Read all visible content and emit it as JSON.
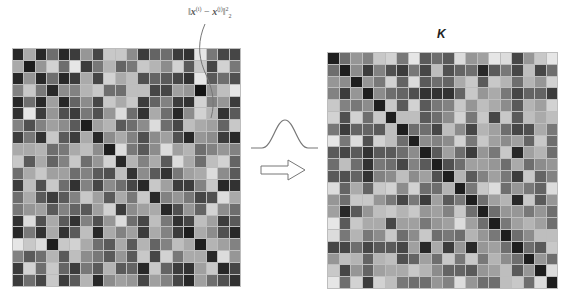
{
  "formula": {
    "norm_open": "‖",
    "x_i": "x",
    "sup_i": "(i)",
    "minus": " − ",
    "x_j": "x",
    "sup_j": "(j)",
    "norm_close": "‖",
    "sup_2": "2",
    "sub_2": "2"
  },
  "kernel_label": "K",
  "icons": {
    "gaussian": "gaussian-curve-icon",
    "arrow": "right-arrow-icon"
  },
  "colors": {
    "grid_line": "#bdbdbd",
    "curve": "#777777",
    "arrow_stroke": "#777777"
  },
  "left_matrix": {
    "size": 20,
    "shades": [
      [
        40,
        170,
        40,
        110,
        40,
        60,
        150,
        70,
        200,
        200,
        140,
        60,
        100,
        110,
        60,
        50,
        230,
        120,
        70,
        70
      ],
      [
        170,
        30,
        150,
        210,
        110,
        230,
        60,
        120,
        180,
        100,
        120,
        200,
        180,
        140,
        210,
        90,
        200,
        70,
        210,
        120
      ],
      [
        40,
        150,
        40,
        110,
        40,
        60,
        170,
        70,
        210,
        170,
        190,
        80,
        100,
        90,
        70,
        50,
        230,
        90,
        110,
        80
      ],
      [
        130,
        200,
        120,
        40,
        140,
        130,
        180,
        200,
        110,
        110,
        190,
        190,
        70,
        70,
        160,
        150,
        20,
        150,
        190,
        230
      ],
      [
        40,
        110,
        40,
        160,
        40,
        100,
        140,
        70,
        200,
        170,
        200,
        60,
        100,
        130,
        60,
        50,
        210,
        130,
        150,
        60
      ],
      [
        50,
        230,
        60,
        150,
        80,
        60,
        120,
        80,
        150,
        220,
        110,
        50,
        170,
        110,
        40,
        140,
        210,
        180,
        50,
        90
      ],
      [
        130,
        80,
        130,
        160,
        140,
        90,
        30,
        160,
        180,
        90,
        110,
        140,
        220,
        110,
        70,
        190,
        170,
        160,
        100,
        200
      ],
      [
        60,
        120,
        50,
        200,
        90,
        60,
        170,
        40,
        140,
        170,
        130,
        80,
        140,
        160,
        80,
        40,
        150,
        140,
        60,
        40
      ],
      [
        170,
        170,
        180,
        110,
        120,
        170,
        190,
        140,
        30,
        220,
        120,
        90,
        140,
        220,
        160,
        180,
        110,
        130,
        150,
        130
      ],
      [
        200,
        90,
        170,
        100,
        130,
        200,
        110,
        150,
        210,
        40,
        180,
        130,
        170,
        90,
        220,
        170,
        110,
        190,
        210,
        100
      ],
      [
        110,
        170,
        200,
        160,
        160,
        110,
        130,
        90,
        80,
        190,
        50,
        140,
        90,
        50,
        120,
        160,
        170,
        220,
        140,
        90
      ],
      [
        60,
        190,
        80,
        200,
        110,
        50,
        130,
        70,
        140,
        110,
        70,
        40,
        200,
        160,
        60,
        60,
        130,
        200,
        40,
        50
      ],
      [
        110,
        170,
        90,
        60,
        90,
        130,
        200,
        160,
        90,
        170,
        120,
        200,
        40,
        130,
        150,
        120,
        70,
        80,
        220,
        170
      ],
      [
        120,
        150,
        160,
        90,
        130,
        100,
        90,
        160,
        210,
        60,
        140,
        160,
        170,
        40,
        80,
        150,
        100,
        210,
        140,
        110
      ],
      [
        50,
        220,
        80,
        170,
        90,
        50,
        130,
        80,
        150,
        220,
        110,
        70,
        190,
        120,
        50,
        70,
        190,
        160,
        60,
        90
      ],
      [
        40,
        120,
        50,
        170,
        50,
        90,
        190,
        40,
        170,
        130,
        160,
        60,
        170,
        130,
        60,
        30,
        170,
        140,
        80,
        40
      ],
      [
        230,
        200,
        220,
        30,
        200,
        210,
        170,
        110,
        90,
        170,
        90,
        180,
        100,
        130,
        190,
        170,
        30,
        180,
        160,
        130
      ],
      [
        130,
        90,
        110,
        180,
        90,
        190,
        140,
        120,
        90,
        150,
        90,
        200,
        70,
        210,
        120,
        170,
        170,
        40,
        220,
        150
      ],
      [
        60,
        210,
        110,
        200,
        100,
        60,
        120,
        90,
        180,
        90,
        100,
        40,
        200,
        100,
        60,
        50,
        160,
        200,
        40,
        70
      ],
      [
        60,
        110,
        70,
        200,
        60,
        90,
        180,
        40,
        140,
        160,
        150,
        70,
        160,
        130,
        70,
        40,
        160,
        110,
        80,
        50
      ]
    ]
  },
  "right_matrix": {
    "size": 20,
    "shades": [
      [
        30,
        110,
        150,
        130,
        200,
        210,
        120,
        230,
        90,
        110,
        90,
        220,
        150,
        160,
        230,
        220,
        70,
        150,
        200,
        230
      ],
      [
        110,
        30,
        140,
        60,
        130,
        80,
        60,
        120,
        70,
        190,
        80,
        100,
        110,
        40,
        90,
        120,
        70,
        190,
        70,
        110
      ],
      [
        150,
        140,
        30,
        150,
        120,
        210,
        100,
        220,
        90,
        110,
        100,
        170,
        200,
        90,
        200,
        180,
        110,
        180,
        150,
        210
      ],
      [
        130,
        60,
        150,
        30,
        140,
        110,
        100,
        80,
        50,
        50,
        50,
        100,
        200,
        150,
        170,
        120,
        70,
        100,
        100,
        60
      ],
      [
        200,
        130,
        120,
        140,
        30,
        200,
        90,
        210,
        90,
        120,
        130,
        200,
        150,
        190,
        170,
        140,
        90,
        180,
        160,
        210
      ],
      [
        210,
        80,
        210,
        110,
        200,
        30,
        190,
        190,
        90,
        110,
        140,
        210,
        120,
        200,
        70,
        200,
        90,
        190,
        170,
        190
      ],
      [
        120,
        60,
        100,
        100,
        90,
        190,
        30,
        110,
        110,
        70,
        190,
        140,
        70,
        180,
        160,
        110,
        70,
        80,
        170,
        120
      ],
      [
        230,
        120,
        220,
        80,
        210,
        190,
        110,
        30,
        140,
        130,
        140,
        210,
        120,
        200,
        160,
        140,
        160,
        100,
        200,
        110
      ],
      [
        90,
        70,
        90,
        50,
        90,
        90,
        110,
        140,
        30,
        90,
        160,
        110,
        60,
        150,
        120,
        200,
        40,
        160,
        180,
        110
      ],
      [
        110,
        190,
        110,
        50,
        120,
        110,
        70,
        130,
        90,
        30,
        80,
        110,
        160,
        160,
        150,
        110,
        170,
        110,
        140,
        150
      ],
      [
        90,
        80,
        100,
        50,
        130,
        140,
        190,
        140,
        160,
        80,
        30,
        180,
        90,
        130,
        160,
        120,
        60,
        200,
        100,
        130
      ],
      [
        220,
        100,
        170,
        100,
        200,
        210,
        140,
        210,
        110,
        110,
        180,
        30,
        120,
        200,
        220,
        110,
        150,
        120,
        100,
        220
      ],
      [
        150,
        110,
        200,
        200,
        150,
        120,
        70,
        120,
        60,
        160,
        90,
        120,
        30,
        110,
        160,
        180,
        40,
        200,
        90,
        150
      ],
      [
        160,
        40,
        90,
        150,
        190,
        200,
        180,
        200,
        150,
        160,
        130,
        200,
        110,
        30,
        110,
        150,
        150,
        120,
        150,
        110
      ],
      [
        230,
        90,
        200,
        170,
        170,
        70,
        160,
        160,
        120,
        150,
        160,
        220,
        160,
        110,
        30,
        120,
        160,
        180,
        160,
        110
      ],
      [
        220,
        120,
        180,
        120,
        140,
        200,
        110,
        140,
        200,
        110,
        120,
        110,
        180,
        150,
        120,
        30,
        110,
        140,
        190,
        190
      ],
      [
        70,
        70,
        110,
        70,
        90,
        90,
        70,
        160,
        40,
        170,
        60,
        150,
        40,
        150,
        160,
        110,
        30,
        110,
        90,
        200
      ],
      [
        150,
        190,
        180,
        100,
        180,
        190,
        80,
        100,
        160,
        110,
        200,
        120,
        200,
        120,
        180,
        140,
        110,
        30,
        150,
        110
      ],
      [
        200,
        70,
        150,
        100,
        160,
        170,
        170,
        200,
        180,
        140,
        100,
        100,
        90,
        150,
        160,
        190,
        90,
        150,
        30,
        220
      ],
      [
        230,
        110,
        210,
        60,
        210,
        190,
        120,
        110,
        110,
        150,
        130,
        220,
        150,
        110,
        110,
        190,
        200,
        110,
        220,
        30
      ]
    ]
  }
}
